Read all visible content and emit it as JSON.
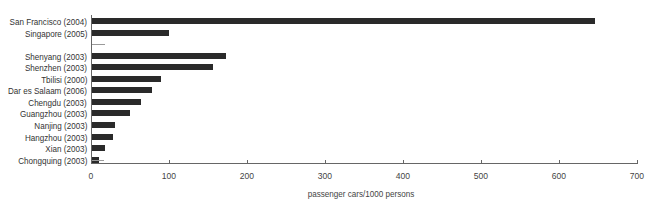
{
  "chart_data": {
    "type": "bar",
    "orientation": "horizontal",
    "title": "",
    "xlabel": "passenger cars/1000 persons",
    "ylabel": "",
    "xlim": [
      0,
      700
    ],
    "xticks": [
      0,
      100,
      200,
      300,
      400,
      500,
      600,
      700
    ],
    "grid": false,
    "legend": null,
    "categories": [
      "San Francisco (2004)",
      "Singapore (2005)",
      "",
      "Shenyang (2003)",
      "Shenzhen (2003)",
      "Tbilisi (2000)",
      "Dar es Salaam (2006)",
      "Chengdu (2003)",
      "Guangzhou (2003)",
      "Nanjing (2003)",
      "Hangzhou (2003)",
      "Xian (2003)",
      "Chongquing (2003)"
    ],
    "values": [
      645,
      99,
      null,
      172,
      155,
      88,
      77,
      63,
      49,
      30,
      27,
      17,
      9
    ],
    "reference_marks": [
      {
        "row": 2,
        "value": 17
      },
      {
        "row": 12,
        "value": 16
      }
    ],
    "bar_color": "#2a2a2a",
    "reference_color": "#9a9a9a"
  },
  "axis": {
    "x_title": "passenger cars/1000 persons",
    "tick_labels": [
      "0",
      "100",
      "200",
      "300",
      "400",
      "500",
      "600",
      "700"
    ]
  }
}
